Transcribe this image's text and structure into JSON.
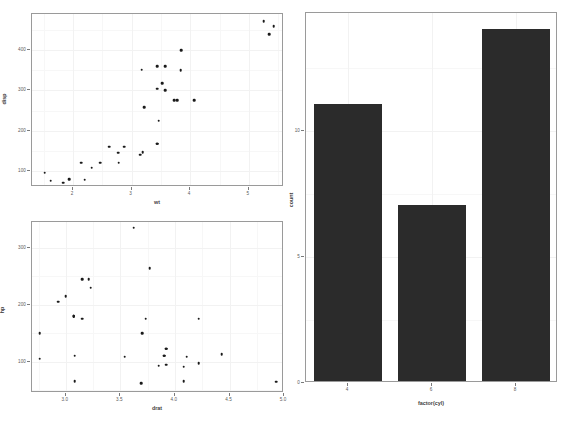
{
  "figure": {
    "background": "#ffffff",
    "panel_border_color": "#9a9a9a",
    "grid_color": "#f2f2f2",
    "point_color": "#1a1a1a",
    "bar_color": "#2b2b2b",
    "panel_count": 3
  },
  "chart_data": [
    {
      "type": "scatter",
      "name": "disp-vs-wt",
      "title": "",
      "xlabel": "wt",
      "ylabel": "disp",
      "xlim": [
        1.3,
        5.6
      ],
      "ylim": [
        60,
        490
      ],
      "xticks": [
        2,
        3,
        4,
        5
      ],
      "xticklabels": [
        "2",
        "3",
        "4",
        "5"
      ],
      "yticks": [
        100,
        200,
        300,
        400
      ],
      "yticklabels": [
        "100",
        "200",
        "300",
        "400"
      ],
      "grid": true,
      "legend": "none",
      "x": [
        2.62,
        2.875,
        2.32,
        3.215,
        3.44,
        3.46,
        3.57,
        3.19,
        3.15,
        3.44,
        3.44,
        4.07,
        3.73,
        3.78,
        5.25,
        5.424,
        5.345,
        2.2,
        1.615,
        1.835,
        2.465,
        3.52,
        3.435,
        3.84,
        3.845,
        1.935,
        2.14,
        1.513,
        3.17,
        2.77,
        3.57,
        2.78
      ],
      "y": [
        160.0,
        160.0,
        108.0,
        258.0,
        360.0,
        225.0,
        360.0,
        146.7,
        140.8,
        167.6,
        167.6,
        275.8,
        275.8,
        275.8,
        472.0,
        460.0,
        440.0,
        78.7,
        75.7,
        71.1,
        120.1,
        318.0,
        304.0,
        350.0,
        400.0,
        79.0,
        120.3,
        95.1,
        351.0,
        145.0,
        301.0,
        121.0
      ]
    },
    {
      "type": "scatter",
      "name": "hp-vs-drat",
      "title": "",
      "xlabel": "drat",
      "ylabel": "hp",
      "xlim": [
        2.69,
        5.0
      ],
      "ylim": [
        45,
        345
      ],
      "xticks": [
        3.0,
        3.5,
        4.0,
        4.5,
        5.0
      ],
      "xticklabels": [
        "3.0",
        "3.5",
        "4.0",
        "4.5",
        "5.0"
      ],
      "yticks": [
        100,
        200,
        300
      ],
      "yticklabels": [
        "100",
        "200",
        "300"
      ],
      "grid": true,
      "legend": "none",
      "x": [
        3.9,
        3.9,
        3.85,
        3.08,
        3.15,
        2.76,
        3.21,
        3.69,
        3.92,
        3.92,
        3.92,
        3.07,
        3.07,
        3.07,
        2.93,
        3.0,
        3.23,
        4.08,
        4.93,
        4.22,
        3.7,
        2.76,
        3.15,
        3.73,
        3.08,
        4.08,
        4.43,
        3.77,
        4.22,
        3.62,
        3.54,
        4.11
      ],
      "y": [
        110,
        110,
        93,
        110,
        175,
        105,
        245,
        62,
        95,
        123,
        123,
        180,
        180,
        180,
        205,
        215,
        230,
        66,
        65,
        97,
        150,
        150,
        245,
        175,
        66,
        91,
        113,
        264,
        175,
        335,
        109,
        109
      ]
    },
    {
      "type": "bar",
      "name": "count-by-cyl",
      "title": "",
      "xlabel": "factor(cyl)",
      "ylabel": "count",
      "categories": [
        "4",
        "6",
        "8"
      ],
      "values": [
        11,
        7,
        14
      ],
      "ylim": [
        0,
        14.7
      ],
      "yticks": [
        0,
        5,
        10
      ],
      "yticklabels": [
        "0",
        "5",
        "10"
      ],
      "grid": true,
      "legend": "none",
      "bar_color": "#2b2b2b"
    }
  ]
}
